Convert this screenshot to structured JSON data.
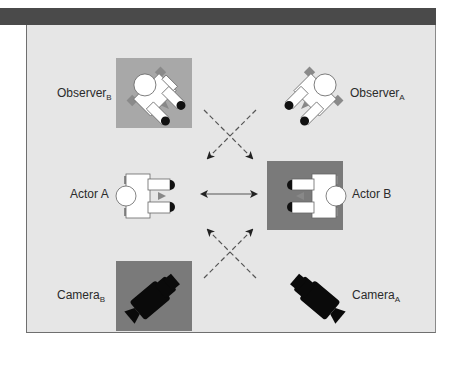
{
  "diagram": {
    "colors": {
      "header_bar": "#4a4a4a",
      "panel_bg": "#e6e6e6",
      "tile_light": "#a8a8a8",
      "tile_dark": "#7a7a7a",
      "figure_fill": "#ffffff",
      "figure_outline": "#555555",
      "feet": "#111111",
      "camera": "#0a0a0a",
      "arrow": "#555555"
    },
    "labels": {
      "observer_b": {
        "base": "Observer",
        "sub": "B"
      },
      "observer_a": {
        "base": "Observer",
        "sub": "A"
      },
      "actor_a": {
        "base": "Actor A"
      },
      "actor_b": {
        "base": "Actor B"
      },
      "camera_b": {
        "base": "Camera",
        "sub": "B"
      },
      "camera_a": {
        "base": "Camera",
        "sub": "A"
      }
    },
    "arrows": {
      "between_actors": "solid double-headed",
      "top_cross": "dashed, observers to actors",
      "bottom_cross": "dashed, cameras to actors"
    }
  }
}
